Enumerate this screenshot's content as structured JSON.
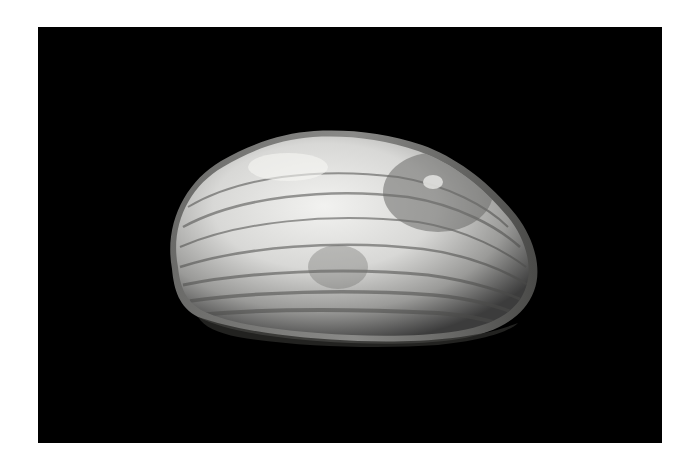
{
  "image": {
    "subject": "Freshwater mussel shell (single valve)",
    "background_color": "#000000",
    "border_color": "#ffffff",
    "shell_colors": {
      "highlight": "#e8e8e6",
      "mid": "#9a9a98",
      "shadow": "#3c3c3c",
      "edge": "#5a5a58"
    }
  }
}
